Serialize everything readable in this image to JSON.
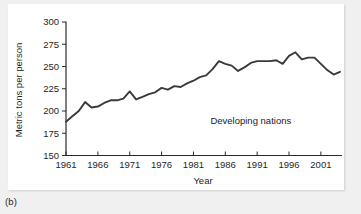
{
  "figure": {
    "caption": "(b)",
    "background_color": "#f0f0f0",
    "panel_color": "#ffffff"
  },
  "chart_data": {
    "type": "line",
    "title": "",
    "xlabel": "Year",
    "ylabel": "Metric tons per person",
    "xlim": [
      1961,
      2004
    ],
    "ylim": [
      150,
      300
    ],
    "xticks": [
      1961,
      1966,
      1971,
      1976,
      1981,
      1986,
      1991,
      1996,
      2001
    ],
    "yticks": [
      150,
      175,
      200,
      225,
      250,
      275,
      300
    ],
    "grid": false,
    "legend": "none",
    "annotations": [
      {
        "text": "Developing nations",
        "x": 1990,
        "y": 186
      }
    ],
    "series": [
      {
        "name": "Developing nations",
        "color": "#3a3a3a",
        "x": [
          1961,
          1962,
          1963,
          1964,
          1965,
          1966,
          1967,
          1968,
          1969,
          1970,
          1971,
          1972,
          1973,
          1974,
          1975,
          1976,
          1977,
          1978,
          1979,
          1980,
          1981,
          1982,
          1983,
          1984,
          1985,
          1986,
          1987,
          1988,
          1989,
          1990,
          1991,
          1992,
          1993,
          1994,
          1995,
          1996,
          1997,
          1998,
          1999,
          2000,
          2001,
          2002,
          2003,
          2004
        ],
        "values": [
          188,
          194,
          200,
          210,
          204,
          205,
          209,
          212,
          212,
          214,
          222,
          213,
          216,
          219,
          221,
          226,
          224,
          228,
          227,
          231,
          234,
          238,
          240,
          247,
          256,
          253,
          251,
          245,
          249,
          254,
          256,
          256,
          256,
          257,
          253,
          262,
          266,
          258,
          260,
          260,
          253,
          246,
          241,
          244
        ]
      }
    ]
  }
}
